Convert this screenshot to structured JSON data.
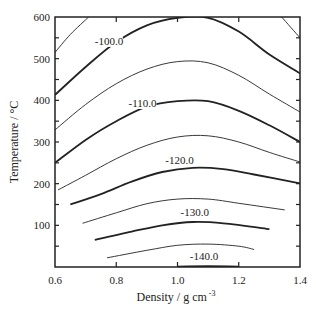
{
  "chart_data": {
    "type": "contour",
    "title": "",
    "xlabel": "Density / g cm",
    "xlabel_superscript": "-3",
    "ylabel": "Temperature / °C",
    "xlim": [
      0.6,
      1.4
    ],
    "ylim": [
      0,
      600
    ],
    "xticks": [
      0.6,
      0.8,
      1.0,
      1.2,
      1.4
    ],
    "xtick_labels": [
      "0.6",
      "0.8",
      "1.0",
      "1.2",
      "1.4"
    ],
    "yticks": [
      100,
      200,
      300,
      400,
      500,
      600
    ],
    "ytick_labels": [
      "100",
      "200",
      "300",
      "400",
      "500",
      "600"
    ],
    "ytick_minor_step": 50,
    "grid": false,
    "legend": null,
    "line_color": "#222222",
    "contours": [
      {
        "level": -95.0,
        "style": "thin",
        "points": [
          [
            0.6,
            515
          ],
          [
            0.65,
            558
          ],
          [
            0.71,
            600
          ]
        ]
      },
      {
        "level": -100.0,
        "style": "thin",
        "points": [
          [
            1.34,
            600
          ],
          [
            1.37,
            575
          ],
          [
            1.4,
            550
          ]
        ]
      },
      {
        "level": -100.0,
        "style": "thick",
        "label": "-100.0",
        "points": [
          [
            0.6,
            413
          ],
          [
            0.7,
            480
          ],
          [
            0.8,
            540
          ],
          [
            0.9,
            580
          ],
          [
            1.0,
            598
          ],
          [
            1.1,
            598
          ],
          [
            1.2,
            565
          ],
          [
            1.3,
            510
          ],
          [
            1.4,
            465
          ]
        ]
      },
      {
        "level": -105.0,
        "style": "thin",
        "points": [
          [
            0.6,
            329
          ],
          [
            0.7,
            390
          ],
          [
            0.8,
            440
          ],
          [
            0.9,
            475
          ],
          [
            1.0,
            493
          ],
          [
            1.1,
            490
          ],
          [
            1.2,
            460
          ],
          [
            1.3,
            415
          ],
          [
            1.4,
            372
          ]
        ]
      },
      {
        "level": -110.0,
        "style": "thick",
        "label": "-110.0",
        "points": [
          [
            0.6,
            250
          ],
          [
            0.7,
            305
          ],
          [
            0.8,
            350
          ],
          [
            0.9,
            385
          ],
          [
            1.0,
            398
          ],
          [
            1.1,
            398
          ],
          [
            1.2,
            375
          ],
          [
            1.3,
            340
          ],
          [
            1.4,
            300
          ]
        ]
      },
      {
        "level": -115.0,
        "style": "thin",
        "points": [
          [
            0.61,
            185
          ],
          [
            0.7,
            220
          ],
          [
            0.8,
            260
          ],
          [
            0.9,
            292
          ],
          [
            1.0,
            312
          ],
          [
            1.1,
            315
          ],
          [
            1.2,
            300
          ],
          [
            1.3,
            275
          ],
          [
            1.4,
            252
          ]
        ]
      },
      {
        "level": -120.0,
        "style": "thick",
        "label": "-120.0",
        "points": [
          [
            0.65,
            150
          ],
          [
            0.75,
            175
          ],
          [
            0.85,
            205
          ],
          [
            0.95,
            228
          ],
          [
            1.05,
            238
          ],
          [
            1.15,
            235
          ],
          [
            1.25,
            222
          ],
          [
            1.4,
            201
          ]
        ]
      },
      {
        "level": -125.0,
        "style": "thin",
        "points": [
          [
            0.69,
            105
          ],
          [
            0.8,
            130
          ],
          [
            0.9,
            152
          ],
          [
            1.0,
            163
          ],
          [
            1.1,
            163
          ],
          [
            1.2,
            153
          ],
          [
            1.35,
            137
          ]
        ]
      },
      {
        "level": -130.0,
        "style": "thick",
        "label": "-130.0",
        "points": [
          [
            0.73,
            65
          ],
          [
            0.85,
            85
          ],
          [
            0.95,
            100
          ],
          [
            1.05,
            108
          ],
          [
            1.15,
            105
          ],
          [
            1.3,
            91
          ]
        ]
      },
      {
        "level": -135.0,
        "style": "thin",
        "points": [
          [
            0.77,
            22
          ],
          [
            0.9,
            40
          ],
          [
            1.0,
            52
          ],
          [
            1.1,
            55
          ],
          [
            1.2,
            50
          ],
          [
            1.25,
            42
          ]
        ]
      },
      {
        "level": -140.0,
        "style": "thick",
        "label": "-140.0",
        "points": [
          [
            1.0,
            1
          ],
          [
            1.1,
            2
          ],
          [
            1.2,
            1
          ]
        ]
      }
    ],
    "contour_labels": [
      {
        "text": "-100.0",
        "x": 0.73,
        "y": 533
      },
      {
        "text": "-110.0",
        "x": 0.84,
        "y": 384
      },
      {
        "text": "-120.0",
        "x": 0.96,
        "y": 247
      },
      {
        "text": "-130.0",
        "x": 1.01,
        "y": 122
      },
      {
        "text": "-140.0",
        "x": 1.04,
        "y": 16
      }
    ]
  }
}
